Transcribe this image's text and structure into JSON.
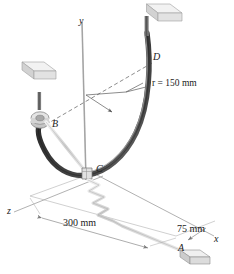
{
  "figure": {
    "background_color": "#ffffff",
    "ink_color": "#1a1a1a"
  },
  "axes": [
    {
      "name": "y-axis",
      "label": "y"
    },
    {
      "name": "x-axis",
      "label": "x"
    },
    {
      "name": "z-axis",
      "label": "z"
    }
  ],
  "points": [
    {
      "name": "point-b",
      "label": "B"
    },
    {
      "name": "point-c",
      "label": "C"
    },
    {
      "name": "point-d",
      "label": "D"
    },
    {
      "name": "point-a",
      "label": "A"
    }
  ],
  "dimensions": [
    {
      "name": "radius",
      "label": "r = 150 mm",
      "symbol": "r",
      "value": "150",
      "unit": "mm"
    },
    {
      "name": "length-300",
      "label": "300 mm",
      "value": "300",
      "unit": "mm"
    },
    {
      "name": "length-75",
      "label": "75 mm",
      "value": "75",
      "unit": "mm"
    }
  ],
  "elements": [
    {
      "name": "curved-rod",
      "description": "dark semicircular rod from B through C to D"
    },
    {
      "name": "cord-bc",
      "description": "light cord from collar B to ring C"
    },
    {
      "name": "spring-ca",
      "description": "zigzag spring from ring C to block A"
    },
    {
      "name": "collar-b",
      "description": "collar at B on support post"
    },
    {
      "name": "ring-c",
      "description": "small ring at C"
    },
    {
      "name": "support-block-b",
      "description": "cube support block above B"
    },
    {
      "name": "support-block-d",
      "description": "cube support block above D"
    },
    {
      "name": "base-block-a",
      "description": "flat base block at A"
    }
  ],
  "colors": {
    "rod_dark": "#3c3c3c",
    "rod_light": "#8a8a8a",
    "cord": "#d8d8d8",
    "spring": "#d2d2d2",
    "block_face": "#e6e6e6",
    "block_top": "#f2f2f2",
    "block_side": "#c9c9c9",
    "axis_line": "#a8a8a8",
    "dim_line": "#9a9a9a",
    "dashed": "#6e6e6e"
  }
}
